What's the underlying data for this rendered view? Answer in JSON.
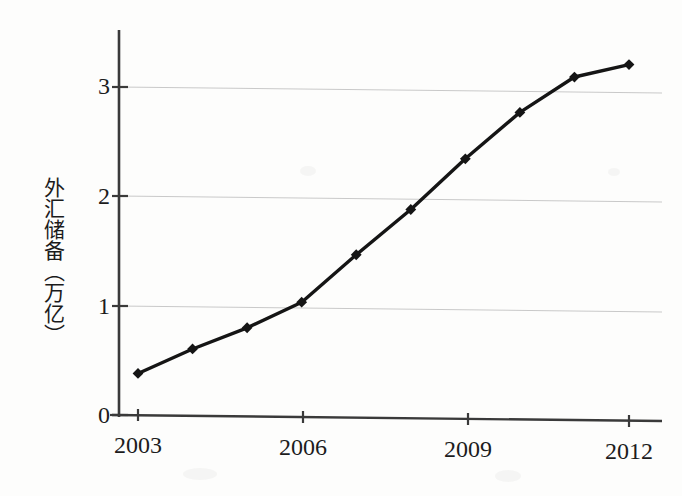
{
  "figure": {
    "background_color": "#fdfdfc",
    "ink_color": "#151515",
    "grid_color": "#c9c9c9",
    "axis_color": "#3a3a3a"
  },
  "axes": {
    "y_axis_title": "外汇储备（万亿）",
    "y_ticks": [
      "0",
      "1",
      "2",
      "3"
    ],
    "x_ticks": [
      "2003",
      "2006",
      "2009",
      "2012"
    ]
  },
  "chart_data": {
    "type": "line",
    "title": "",
    "xlabel": "",
    "ylabel": "外汇储备（万亿）",
    "categories": [
      "2003",
      "2004",
      "2005",
      "2006",
      "2007",
      "2008",
      "2009",
      "2010",
      "2011",
      "2012"
    ],
    "x": [
      2003,
      2004,
      2005,
      2006,
      2007,
      2008,
      2009,
      2010,
      2011,
      2012
    ],
    "values": [
      0.38,
      0.61,
      0.81,
      1.05,
      1.49,
      1.91,
      2.38,
      2.81,
      3.14,
      3.26
    ],
    "series": [
      {
        "name": "外汇储备（万亿）",
        "values": [
          0.38,
          0.61,
          0.81,
          1.05,
          1.49,
          1.91,
          2.38,
          2.81,
          3.14,
          3.26
        ]
      }
    ],
    "xlim": [
      2002.6,
      2012.6
    ],
    "ylim": [
      0,
      3.55
    ],
    "y_tick_values": [
      0,
      1,
      2,
      3
    ],
    "x_tick_values": [
      2003,
      2006,
      2009,
      2012
    ],
    "grid": "horizontal",
    "legend": "none",
    "marker": "diamond",
    "line_color": "#151515",
    "marker_color": "#151515"
  }
}
